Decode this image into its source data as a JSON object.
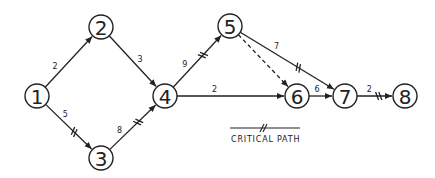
{
  "diagram": {
    "type": "activity-on-arrow network",
    "nodes": [
      {
        "id": "1",
        "label": "1",
        "x": 37,
        "y": 96
      },
      {
        "id": "2",
        "label": "2",
        "x": 101,
        "y": 27
      },
      {
        "id": "3",
        "label": "3",
        "x": 101,
        "y": 158
      },
      {
        "id": "4",
        "label": "4",
        "x": 165,
        "y": 96
      },
      {
        "id": "5",
        "label": "5",
        "x": 230,
        "y": 26
      },
      {
        "id": "6",
        "label": "6",
        "x": 297,
        "y": 96
      },
      {
        "id": "7",
        "label": "7",
        "x": 345,
        "y": 96
      },
      {
        "id": "8",
        "label": "8",
        "x": 405,
        "y": 96
      }
    ],
    "edges": [
      {
        "from": "1",
        "to": "2",
        "duration": "2",
        "critical": false,
        "dashed": false
      },
      {
        "from": "1",
        "to": "3",
        "duration": "5",
        "critical": true,
        "dashed": false
      },
      {
        "from": "2",
        "to": "4",
        "duration": "3",
        "critical": false,
        "dashed": false
      },
      {
        "from": "3",
        "to": "4",
        "duration": "8",
        "critical": true,
        "dashed": false
      },
      {
        "from": "4",
        "to": "5",
        "duration": "9",
        "critical": true,
        "dashed": false
      },
      {
        "from": "4",
        "to": "6",
        "duration": "2",
        "critical": false,
        "dashed": false
      },
      {
        "from": "5",
        "to": "6",
        "duration": "",
        "critical": false,
        "dashed": true
      },
      {
        "from": "5",
        "to": "7",
        "duration": "7",
        "critical": true,
        "dashed": false
      },
      {
        "from": "6",
        "to": "7",
        "duration": "6",
        "critical": false,
        "dashed": false
      },
      {
        "from": "7",
        "to": "8",
        "duration": "2",
        "critical": true,
        "dashed": false
      }
    ],
    "legend": {
      "label": "CRITICAL PATH",
      "symbol": "double-tick line"
    }
  }
}
